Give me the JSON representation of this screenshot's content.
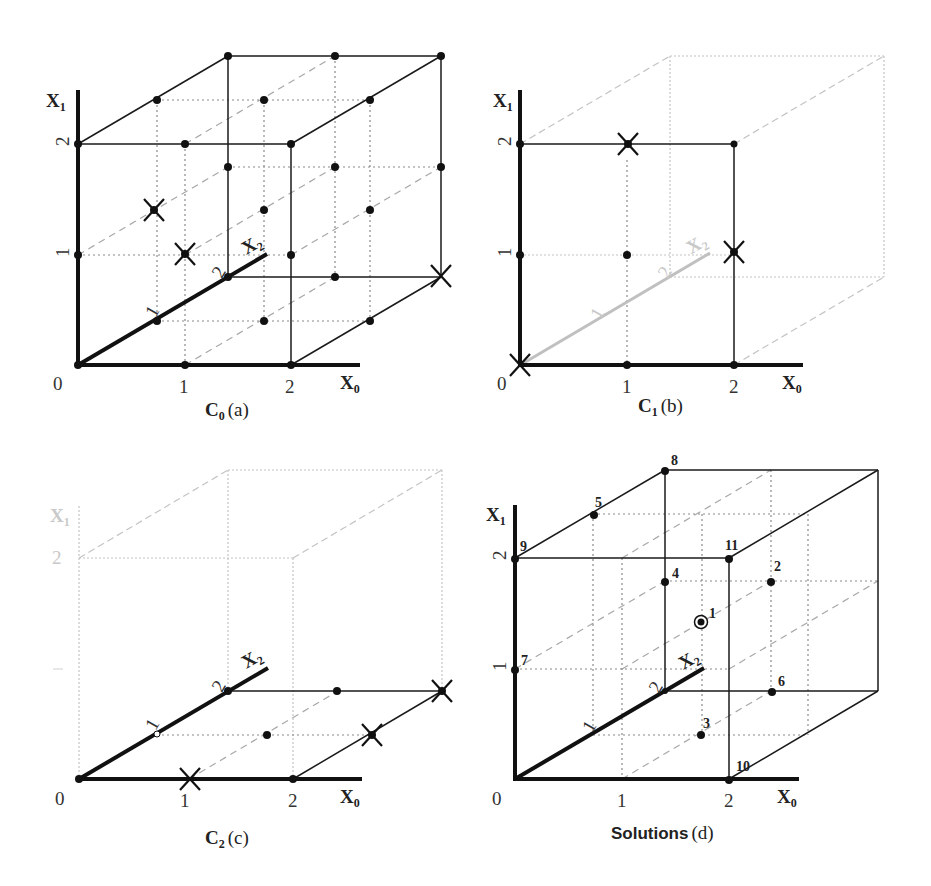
{
  "axes": {
    "x0": "X",
    "x0_sub": "0",
    "x1": "X",
    "x1_sub": "1",
    "x2": "X",
    "x2_sub": "2",
    "origin": "0",
    "tick_1": "1",
    "tick_2": "2"
  },
  "panels": [
    {
      "id": "a",
      "caption_main": "C",
      "caption_sub": "0",
      "caption_tag": "(a)",
      "description": "Full 3x3x3 lattice of X0,X1,X2 in {0,1,2}; three points crossed out"
    },
    {
      "id": "b",
      "caption_main": "C",
      "caption_sub": "1",
      "caption_tag": "(b)",
      "description": "Front X0-X1 plane (X2=0) highlighted; crosses at (0,0), (1,2), (2,1)"
    },
    {
      "id": "c",
      "caption_main": "C",
      "caption_sub": "2",
      "caption_tag": "(c)",
      "description": "Bottom X0-X2 plane (X1=0) highlighted; crosses at (1,0), (2,1), (2,2)"
    },
    {
      "id": "d",
      "caption_main": "Solutions",
      "caption_sub": "",
      "caption_tag": "(d)",
      "description": "Remaining solution points numbered 1-11; point 1 circled",
      "solution_labels": [
        "1",
        "2",
        "3",
        "4",
        "5",
        "6",
        "7",
        "8",
        "9",
        "10",
        "11"
      ]
    }
  ]
}
